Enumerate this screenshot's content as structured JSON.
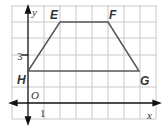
{
  "diagram": {
    "type": "coordinate-plane-trapezoid",
    "axes": {
      "x_label": "x",
      "y_label": "y",
      "origin_label": "O",
      "x_tick_label": "1",
      "y_tick_label": "3"
    },
    "grid": {
      "x_range": [
        -1,
        8
      ],
      "y_range": [
        -1,
        6
      ],
      "unit": 1
    },
    "vertices": [
      {
        "label": "E",
        "x": 2,
        "y": 5
      },
      {
        "label": "F",
        "x": 5,
        "y": 5
      },
      {
        "label": "G",
        "x": 7,
        "y": 2
      },
      {
        "label": "H",
        "x": 0,
        "y": 2
      }
    ],
    "colors": {
      "grid": "#c8c8c8",
      "shape": "#555555",
      "axis": "#111111"
    }
  }
}
